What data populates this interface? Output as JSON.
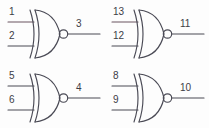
{
  "diagram": {
    "background_color": "#fdfdfd",
    "line_color": "#4a4a55",
    "input_line_color": "#6b5560",
    "label_color": "#3c3c46",
    "gate_type": "xnor",
    "gate_symbol_name": "xnor-gate",
    "gate_count": 4,
    "grid": {
      "columns": 2,
      "rows": 2
    },
    "gates": [
      {
        "id": "gate-1",
        "position": "top-left",
        "type": "xnor",
        "inputs": [
          {
            "name": "input-a",
            "label": "1"
          },
          {
            "name": "input-b",
            "label": "2"
          }
        ],
        "output": {
          "name": "output-y",
          "label": "3"
        }
      },
      {
        "id": "gate-2",
        "position": "top-right",
        "type": "xnor",
        "inputs": [
          {
            "name": "input-a",
            "label": "13"
          },
          {
            "name": "input-b",
            "label": "12"
          }
        ],
        "output": {
          "name": "output-y",
          "label": "11"
        }
      },
      {
        "id": "gate-3",
        "position": "bottom-left",
        "type": "xnor",
        "inputs": [
          {
            "name": "input-a",
            "label": "5"
          },
          {
            "name": "input-b",
            "label": "6"
          }
        ],
        "output": {
          "name": "output-y",
          "label": "4"
        }
      },
      {
        "id": "gate-4",
        "position": "bottom-right",
        "type": "xnor",
        "inputs": [
          {
            "name": "input-a",
            "label": "8"
          },
          {
            "name": "input-b",
            "label": "9"
          }
        ],
        "output": {
          "name": "output-y",
          "label": "10"
        }
      }
    ]
  }
}
